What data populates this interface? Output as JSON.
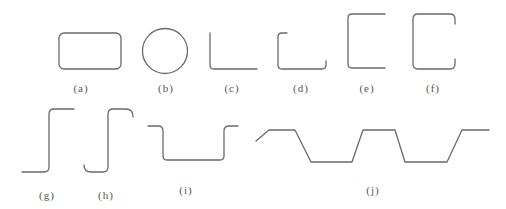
{
  "figure": {
    "stroke_color": "#6a6a6a",
    "label_color": "#555555",
    "panels": [
      {
        "id": "a",
        "label": "(a)",
        "shape": "rounded-rectangle"
      },
      {
        "id": "b",
        "label": "(b)",
        "shape": "circle"
      },
      {
        "id": "c",
        "label": "(c)",
        "shape": "L-angle"
      },
      {
        "id": "d",
        "label": "(d)",
        "shape": "U-channel-short-lip"
      },
      {
        "id": "e",
        "label": "(e)",
        "shape": "C-channel"
      },
      {
        "id": "f",
        "label": "(f)",
        "shape": "C-channel-with-lips"
      },
      {
        "id": "g",
        "label": "(g)",
        "shape": "Z-section"
      },
      {
        "id": "h",
        "label": "(h)",
        "shape": "Z-section-with-lips"
      },
      {
        "id": "i",
        "label": "(i)",
        "shape": "hat-section"
      },
      {
        "id": "j",
        "label": "(j)",
        "shape": "trapezoidal-corrugated-profile"
      }
    ]
  }
}
